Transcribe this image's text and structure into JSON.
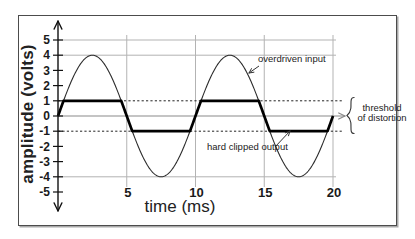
{
  "chart_data": {
    "type": "line",
    "title": "",
    "xlabel": "time (ms)",
    "ylabel": "amplitude (volts)",
    "xlim": [
      0,
      20
    ],
    "ylim": [
      -5,
      5
    ],
    "x_ticks": [
      5,
      10,
      15,
      20
    ],
    "y_ticks": [
      5,
      4,
      3,
      2,
      1,
      0,
      -1,
      -2,
      -3,
      -4,
      -5
    ],
    "h_gridlines_volts": [
      5,
      4,
      -4
    ],
    "v_gridlines_ms": [
      5,
      10,
      15,
      20
    ],
    "threshold_volts": [
      1,
      -1
    ],
    "series": [
      {
        "name": "overdriven input",
        "shape": "sine",
        "amplitude_volts": 4,
        "period_ms": 10,
        "cycles": 2,
        "style": "thin"
      },
      {
        "name": "hard clipped output",
        "shape": "clipped_sine",
        "amplitude_volts": 4,
        "period_ms": 10,
        "clip_volts": 1,
        "style": "thick"
      }
    ],
    "samples": {
      "t_ms": [
        0,
        1,
        2,
        3,
        4,
        5,
        6,
        7,
        8,
        9,
        10,
        11,
        12,
        13,
        14,
        15,
        16,
        17,
        18,
        19,
        20
      ],
      "input_volts": [
        0,
        2.35,
        3.8,
        3.8,
        2.35,
        0,
        -2.35,
        -3.8,
        -3.8,
        -2.35,
        0,
        2.35,
        3.8,
        3.8,
        2.35,
        0,
        -2.35,
        -3.8,
        -3.8,
        -2.35,
        0
      ],
      "output_volts": [
        0,
        1,
        1,
        1,
        1,
        0,
        -1,
        -1,
        -1,
        -1,
        0,
        1,
        1,
        1,
        1,
        0,
        -1,
        -1,
        -1,
        -1,
        0
      ]
    },
    "annotations": {
      "overdriven_input": {
        "label": "overdriven input"
      },
      "hard_clipped_output": {
        "label": "hard clipped output"
      },
      "threshold": {
        "line1": "threshold",
        "line2": "of distortion"
      }
    },
    "legend_position": "none",
    "grid": "partial",
    "colors": {
      "curve": "#2b2b2b",
      "clipped": "#000000",
      "grid": "#b3b3b3",
      "zero_axis": "#8a8a8a",
      "axis": "#111111",
      "annotation": "#333333",
      "text": "#1a1a1a"
    }
  }
}
